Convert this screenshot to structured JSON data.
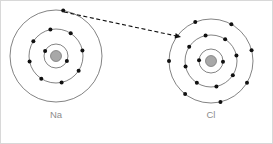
{
  "figure": {
    "background_color": "#ffffff",
    "border_color": "#d8d8d8",
    "ring_color": "#4d4d4d",
    "electron_color": "#111111",
    "nucleus_color": "#a8a8a8",
    "label_color": "#8c8c8c",
    "arrow_color": "#111111"
  },
  "atoms": [
    {
      "id": "sodium",
      "label": "Na",
      "label_x": 55,
      "label_y": 117,
      "center_x": 55,
      "center_y": 55,
      "nucleus_radius": 5.5,
      "shells": [
        {
          "name": "inner-shell",
          "radius": 12,
          "electron_count": 2,
          "electron_angles": [
            205,
            25
          ]
        },
        {
          "name": "middle-shell",
          "radius": 27,
          "electron_count": 8,
          "electron_angles": [
            258,
            303,
            348,
            33,
            78,
            123,
            168,
            213
          ]
        },
        {
          "name": "outer-shell",
          "radius": 46,
          "electron_count": 1,
          "electron_angles": [
            279
          ]
        }
      ]
    },
    {
      "id": "chlorine",
      "label": "Cl",
      "label_x": 210,
      "label_y": 117,
      "center_x": 210,
      "center_y": 60,
      "nucleus_radius": 5.5,
      "shells": [
        {
          "name": "inner-shell",
          "radius": 12,
          "electron_count": 2,
          "electron_angles": [
            183,
            3
          ]
        },
        {
          "name": "middle-shell",
          "radius": 26,
          "electron_count": 8,
          "electron_angles": [
            258,
            303,
            348,
            33,
            78,
            123,
            168,
            213
          ]
        },
        {
          "name": "outer-shell",
          "radius": 42,
          "electron_count": 7,
          "electron_angles": [
            248,
            299,
            345,
            31,
            77,
            128,
            180
          ]
        }
      ]
    }
  ],
  "transfer_arrow": {
    "name": "electron-transfer-arrow",
    "style": "dashed",
    "from_x": 63,
    "from_y": 11,
    "to_x": 180,
    "to_y": 36,
    "arrowhead_size": 6
  }
}
